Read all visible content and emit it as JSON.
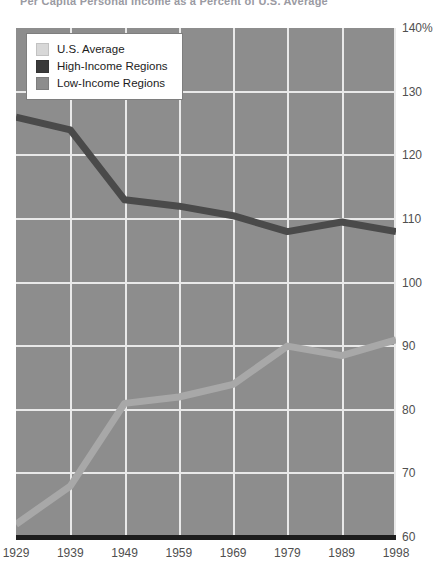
{
  "chart_title": "Per Capita Personal Income as a Percent of U.S. Average",
  "legend": {
    "items": [
      {
        "label": "U.S. Average",
        "color": "#d8d8d8"
      },
      {
        "label": "High-Income Regions",
        "color": "#3a3a3a"
      },
      {
        "label": "Low-Income Regions",
        "color": "#8d8d8d"
      }
    ]
  },
  "y_axis": {
    "ticks": [
      {
        "label": "140%",
        "value": 140
      },
      {
        "label": "130",
        "value": 130
      },
      {
        "label": "120",
        "value": 120
      },
      {
        "label": "110",
        "value": 110
      },
      {
        "label": "100",
        "value": 100
      },
      {
        "label": "90",
        "value": 90
      },
      {
        "label": "80",
        "value": 80
      },
      {
        "label": "70",
        "value": 70
      },
      {
        "label": "60",
        "value": 60
      }
    ]
  },
  "x_axis": {
    "ticks": [
      "1929",
      "1939",
      "1949",
      "1959",
      "1969",
      "1979",
      "1989",
      "1998"
    ]
  },
  "chart_data": {
    "type": "line",
    "title": "Per Capita Personal Income as a Percent of U.S. Average",
    "xlabel": "",
    "ylabel": "",
    "x": [
      1929,
      1939,
      1949,
      1959,
      1969,
      1979,
      1989,
      1998
    ],
    "categories": [
      "1929",
      "1939",
      "1949",
      "1959",
      "1969",
      "1979",
      "1989",
      "1998"
    ],
    "ylim": [
      60,
      140
    ],
    "ytick_step": 10,
    "grid": true,
    "legend_position": "top-left",
    "series": [
      {
        "name": "U.S. Average",
        "color": "#d8d8d8",
        "values": [
          100,
          100,
          100,
          100,
          100,
          100,
          100,
          100
        ],
        "plotted": false
      },
      {
        "name": "High-Income Regions",
        "color": "#4a4a4a",
        "values": [
          126,
          124,
          113,
          112,
          110.5,
          108,
          109.5,
          108
        ],
        "plotted": true
      },
      {
        "name": "Low-Income Regions",
        "color": "#a8a8a8",
        "values": [
          62,
          68,
          81,
          82,
          84,
          90,
          88.5,
          91
        ],
        "plotted": true
      }
    ]
  }
}
